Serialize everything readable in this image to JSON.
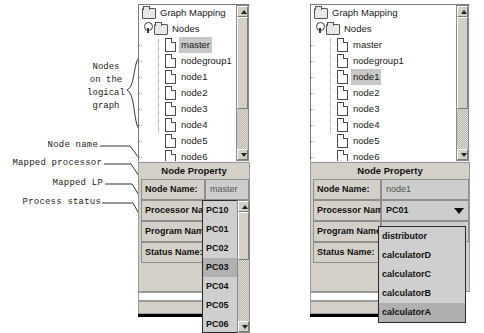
{
  "annotations": {
    "nodes_block": "Nodes\non the\nlogical\ngraph",
    "node_name": "Node name",
    "mapped_processor": "Mapped processor",
    "mapped_lp": "Mapped LP",
    "process_status": "Process status"
  },
  "left_panel": {
    "tree": {
      "root": "Graph Mapping",
      "group": "Nodes",
      "selected": "master",
      "items": [
        "master",
        "nodegroup1",
        "node1",
        "node2",
        "node3",
        "node4",
        "node5",
        "node6"
      ]
    },
    "property": {
      "title": "Node Property",
      "rows": [
        {
          "label": "Node Name:",
          "value": "master",
          "type": "text"
        },
        {
          "label": "Processor Name:",
          "value": "",
          "type": "combo"
        },
        {
          "label": "Program Name:",
          "value": "",
          "type": "combo"
        },
        {
          "label": "Status Name:",
          "value": "",
          "type": "combo"
        }
      ]
    },
    "popup": {
      "options": [
        "PC10",
        "PC01",
        "PC02",
        "PC03",
        "PC04",
        "PC05",
        "PC06"
      ],
      "selected": "PC03"
    }
  },
  "right_panel": {
    "tree": {
      "root": "Graph Mapping",
      "group": "Nodes",
      "selected": "node1",
      "items": [
        "master",
        "nodegroup1",
        "node1",
        "node2",
        "node3",
        "node4",
        "node5",
        "node6"
      ]
    },
    "property": {
      "title": "Node Property",
      "rows": [
        {
          "label": "Node Name:",
          "value": "node1",
          "type": "text"
        },
        {
          "label": "Processor Name:",
          "value": "PC01",
          "type": "combo"
        },
        {
          "label": "Program Name:",
          "value": "",
          "type": "combo"
        },
        {
          "label": "Status Name:",
          "value": "",
          "type": "combo"
        }
      ]
    },
    "popup": {
      "options": [
        "distributor",
        "calculatorD",
        "calculatorC",
        "calculatorB",
        "calculatorA"
      ],
      "selected": "calculatorA"
    }
  },
  "colors": {
    "panel_face": "#d4d0c8",
    "field_face": "#cdcdcd",
    "selection": "#c8c8c8",
    "popup_selection": "#b0b0b0"
  }
}
